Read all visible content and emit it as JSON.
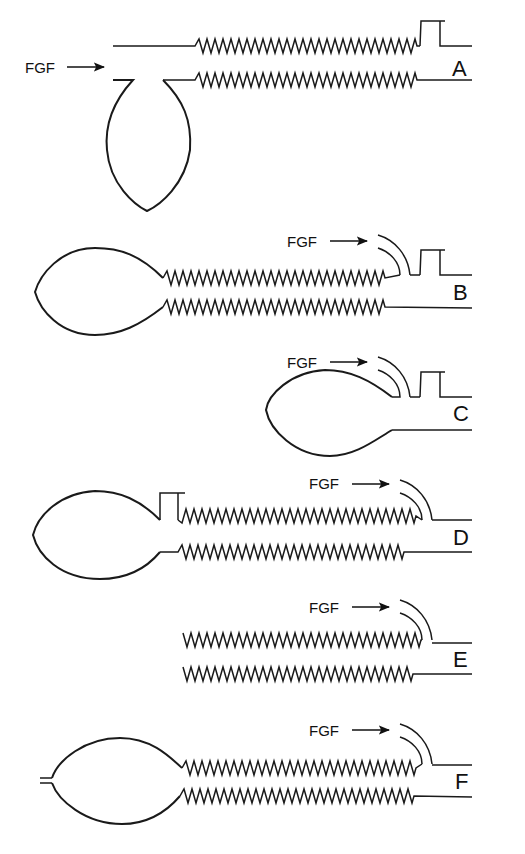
{
  "diagram": {
    "title": "",
    "fgf_label": "FGF",
    "circuits": [
      {
        "id": "A",
        "label": "A",
        "fgf": "FGF"
      },
      {
        "id": "B",
        "label": "B",
        "fgf": "FGF"
      },
      {
        "id": "C",
        "label": "C",
        "fgf": "FGF"
      },
      {
        "id": "D",
        "label": "D",
        "fgf": "FGF"
      },
      {
        "id": "E",
        "label": "E",
        "fgf": "FGF"
      },
      {
        "id": "F",
        "label": "F",
        "fgf": "FGF"
      }
    ],
    "colors": {
      "stroke": "#1a1a1a",
      "background": "#ffffff"
    }
  }
}
